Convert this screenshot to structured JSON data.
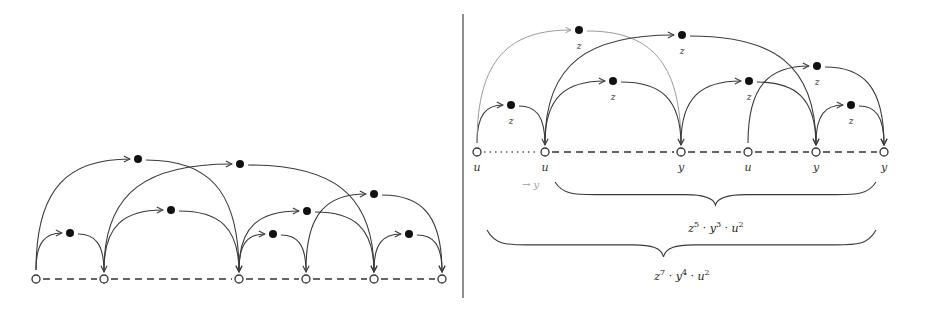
{
  "figure": {
    "divider": {
      "x": 463,
      "y1": 14,
      "y2": 298
    },
    "left_panel": {
      "baseline_y": 279,
      "nodes": [
        {
          "x": 36
        },
        {
          "x": 104
        },
        {
          "x": 239
        },
        {
          "x": 306
        },
        {
          "x": 374
        },
        {
          "x": 442
        }
      ],
      "segments": [
        {
          "from": 0,
          "to": 1,
          "style": "dashed"
        },
        {
          "from": 1,
          "to": 2,
          "style": "dashed"
        },
        {
          "from": 2,
          "to": 3,
          "style": "dashed"
        },
        {
          "from": 3,
          "to": 4,
          "style": "dashed"
        },
        {
          "from": 4,
          "to": 5,
          "style": "dashed"
        }
      ],
      "filled_nodes": [
        {
          "x": 70,
          "y": 233,
          "from": 0,
          "to": 1
        },
        {
          "x": 138,
          "y": 159,
          "from": 0,
          "to": 2
        },
        {
          "x": 171,
          "y": 210,
          "from": 1,
          "to": 2
        },
        {
          "x": 240,
          "y": 164,
          "from": 1,
          "to": 4
        },
        {
          "x": 273,
          "y": 234,
          "from": 2,
          "to": 3
        },
        {
          "x": 307,
          "y": 211,
          "from": 2,
          "to": 4
        },
        {
          "x": 374,
          "y": 194,
          "from": 3,
          "to": 5
        },
        {
          "x": 409,
          "y": 234,
          "from": 4,
          "to": 5
        }
      ]
    },
    "right_panel": {
      "baseline_y": 152,
      "nodes": [
        {
          "x": 477,
          "label": "u"
        },
        {
          "x": 545,
          "label": "u"
        },
        {
          "x": 681,
          "label": "y"
        },
        {
          "x": 748,
          "label": "u"
        },
        {
          "x": 816,
          "label": "y"
        },
        {
          "x": 884,
          "label": "y"
        }
      ],
      "segments": [
        {
          "from": 0,
          "to": 1,
          "style": "dotted"
        },
        {
          "from": 1,
          "to": 2,
          "style": "dashed"
        },
        {
          "from": 2,
          "to": 3,
          "style": "dashed"
        },
        {
          "from": 3,
          "to": 4,
          "style": "dashed"
        },
        {
          "from": 4,
          "to": 5,
          "style": "dashed"
        }
      ],
      "filled_nodes": [
        {
          "x": 511,
          "y": 105,
          "label": "z",
          "from": 0,
          "to": 1,
          "light": false
        },
        {
          "x": 579,
          "y": 30,
          "label": "z",
          "from": 0,
          "to": 2,
          "light": true
        },
        {
          "x": 613,
          "y": 81,
          "label": "z",
          "from": 1,
          "to": 2,
          "light": false
        },
        {
          "x": 682,
          "y": 35,
          "label": "z",
          "from": 1,
          "to": 4,
          "light": false
        },
        {
          "x": 749,
          "y": 81,
          "label": "z",
          "from": 2,
          "to": 4,
          "light": false
        },
        {
          "x": 817,
          "y": 66,
          "label": "z",
          "from": 3,
          "to": 5,
          "light": false
        },
        {
          "x": 851,
          "y": 105,
          "label": "z",
          "from": 4,
          "to": 5,
          "light": false
        }
      ],
      "annotation": {
        "text": "→ y",
        "x": 522,
        "y": 188
      },
      "braces": [
        {
          "x1": 555,
          "x2": 876,
          "top": 182,
          "mid": 205,
          "formula": [
            {
              "base": "z",
              "exp": "5"
            },
            {
              "base": "y",
              "exp": "3"
            },
            {
              "base": "u",
              "exp": "2"
            }
          ],
          "formula_x": 716,
          "formula_y": 232
        },
        {
          "x1": 487,
          "x2": 876,
          "top": 230,
          "mid": 257,
          "formula": [
            {
              "base": "z",
              "exp": "7"
            },
            {
              "base": "y",
              "exp": "4"
            },
            {
              "base": "u",
              "exp": "2"
            }
          ],
          "formula_x": 682,
          "formula_y": 280
        }
      ]
    }
  },
  "text": {
    "formula1": "z⁵ · y³ · u²",
    "formula2": "z⁷ · y⁴ · u²",
    "annotation": "→ y"
  }
}
